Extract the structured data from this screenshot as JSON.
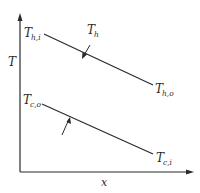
{
  "diagram": {
    "axes": {
      "y_label": "T",
      "x_label": "x"
    },
    "hot_stream": {
      "name": "T",
      "name_sub": "h",
      "inlet_label": "T",
      "inlet_sub": "h,i",
      "outlet_label": "T",
      "outlet_sub": "h,o"
    },
    "cold_stream": {
      "outlet_label": "T",
      "outlet_sub": "c,o",
      "inlet_label": "T",
      "inlet_sub": "c,i"
    },
    "colors": {
      "line": "#2a2a2a",
      "background": "#ffffff"
    }
  }
}
